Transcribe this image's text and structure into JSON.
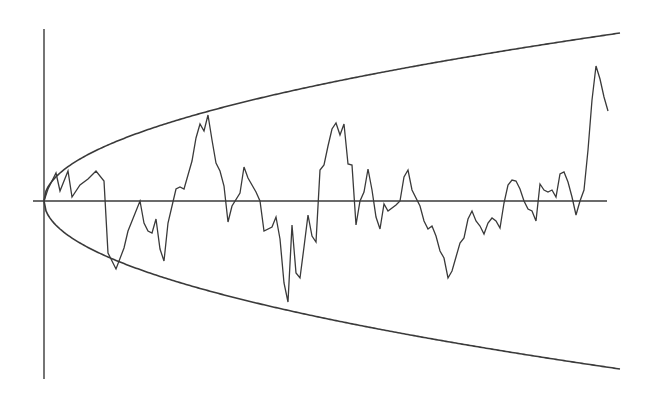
{
  "chart_data": {
    "type": "line",
    "title": "",
    "xlabel": "",
    "ylabel": "",
    "grid": false,
    "legend": null,
    "xlim": [
      0,
      576
    ],
    "ylim": [
      -172,
      172
    ],
    "envelope": {
      "form": "y = ±k·sqrt(t)",
      "k": 7.0,
      "t_range": [
        0,
        576
      ]
    },
    "series": [
      {
        "name": "random-walk",
        "x": [
          0,
          4,
          12,
          16,
          24,
          28,
          36,
          44,
          52,
          60,
          64,
          72,
          80,
          84,
          96,
          100,
          104,
          108,
          112,
          116,
          120,
          124,
          132,
          136,
          140,
          144,
          148,
          152,
          156,
          160,
          164,
          168,
          172,
          176,
          180,
          184,
          188,
          196,
          200,
          204,
          212,
          216,
          220,
          228,
          232,
          236,
          240,
          244,
          248,
          252,
          256,
          260,
          264,
          268,
          272,
          276,
          280,
          284,
          288,
          292,
          296,
          300,
          304,
          308,
          312,
          316,
          320,
          324,
          328,
          332,
          336,
          340,
          344,
          352,
          356,
          360,
          364,
          368,
          376,
          380,
          384,
          388,
          392,
          396,
          400,
          404,
          408,
          412,
          416,
          420,
          424,
          428,
          432,
          436,
          440,
          444,
          448,
          452,
          456,
          460,
          464,
          468,
          472,
          476,
          480,
          484,
          488,
          492,
          496,
          500,
          504,
          508,
          512,
          516,
          520,
          524,
          528,
          532,
          536,
          540,
          544,
          548,
          552,
          556,
          560,
          564
        ],
        "y": [
          0,
          12,
          28,
          10,
          30,
          4,
          16,
          22,
          30,
          20,
          -52,
          -68,
          -47,
          -30,
          0,
          -22,
          -30,
          -32,
          -18,
          -48,
          -60,
          -22,
          12,
          14,
          12,
          26,
          40,
          63,
          77,
          70,
          86,
          61,
          38,
          30,
          15,
          -21,
          -5,
          8,
          34,
          23,
          9,
          0,
          -30,
          -26,
          -16,
          -38,
          -82,
          -101,
          -24,
          -72,
          -77,
          -46,
          -14,
          -35,
          -41,
          31,
          36,
          55,
          72,
          78,
          66,
          77,
          37,
          36,
          -24,
          0,
          9,
          32,
          11,
          -16,
          -28,
          -3,
          -10,
          -4,
          0,
          24,
          31,
          11,
          -5,
          -20,
          -28,
          -25,
          -35,
          -50,
          -57,
          -77,
          -70,
          -56,
          -42,
          -37,
          -18,
          -10,
          -20,
          -25,
          -33,
          -22,
          -17,
          -20,
          -27,
          -2,
          16,
          21,
          20,
          12,
          0,
          -8,
          -10,
          -20,
          17,
          11,
          9,
          11,
          4,
          27,
          29,
          19,
          4,
          -14,
          0,
          11,
          51,
          101,
          135,
          122,
          104,
          90
        ]
      }
    ],
    "pixel_series": {
      "origin_px": [
        44,
        201
      ],
      "walk_points_px": "44,201 48,189 56,175 60,191 66,169 70,197 76,185 80,179 85,171 89,181 92,253 96,269 98,248 102,231 108,201 111,223 113,231 116,233 119,219 122,249 127,261 130,223 134,189 138,187 142,189 146,175 150,161 154,138 158,124 162,131 166,115 170,140 174,163 178,171 182,186 186,222 190,206 197,193 201,167 205,178 213,192 217,201 221,231 229,227 233,217 237,239 241,283 245,302 249,225 253,273 257,278 261,247 265,215 269,236 273,242 277,170 281,165 285,150 289,129 293,123 297,135 301,124 305,164 309,165 313,225 317,201 321,192 325,169 329,190 333,217 337,229 341,204 345,211 353,205 357,201 361,177 365,170 369,190 377,206 381,221 385,229 389,226 393,236 397,251 401,258 405,278 409,271 413,257 417,243 421,238 425,219 429,211 433,221 437,226 441,234 445,223 449,218 453,221 457,228 461,203 465,185 469,180 473,181 477,189 481,201 485,209 489,211 493,221 497,184 501,190 505,192 509,190 513,197 517,174 521,172 525,182 529,197 533,215 537,201 541,190 545,150 549,100 553,66 557,79 561,97 565,111",
      "notes": "Approximate traced pixel coordinates; see rendering path below."
    }
  },
  "axes": {
    "vertical": {
      "x": 44,
      "y_top": 29,
      "y_bottom": 379
    },
    "horizontal": {
      "y": 201,
      "x_left": 33,
      "x_right": 607
    }
  },
  "colors": {
    "background": "#ffffff",
    "line": "#3a3a3a"
  }
}
